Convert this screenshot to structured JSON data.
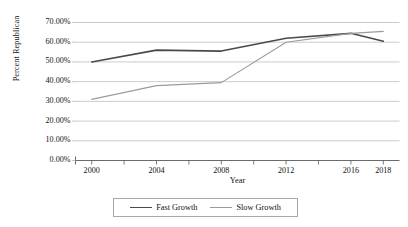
{
  "chart_data": {
    "type": "line",
    "title": "",
    "xlabel": "Year",
    "ylabel": "Percent Republican",
    "x": [
      2000,
      2002,
      2004,
      2006,
      2008,
      2010,
      2012,
      2014,
      2016,
      2018
    ],
    "categories": [
      "2000",
      "2004",
      "2008",
      "2012",
      "2016",
      "2018"
    ],
    "xlim": [
      1999,
      2019
    ],
    "ylim": [
      0,
      70
    ],
    "grid": "horizontal",
    "legend_position": "bottom",
    "xtick_labels": [
      "2000",
      "2004",
      "2008",
      "2012",
      "2016",
      "2018"
    ],
    "xtick_values": [
      2000,
      2004,
      2008,
      2012,
      2016,
      2018
    ],
    "xtick_minor_values": [
      2002,
      2006,
      2010,
      2014
    ],
    "ytick_labels": [
      "0.00%",
      "10.00%",
      "20.00%",
      "30.00%",
      "40.00%",
      "50.00%",
      "60.00%",
      "70.00%"
    ],
    "ytick_values": [
      0,
      10,
      20,
      30,
      40,
      50,
      60,
      70
    ],
    "series": [
      {
        "name": "Fast Growth",
        "color": "#4a4a4a",
        "width": 1.6,
        "x": [
          2000,
          2004,
          2008,
          2012,
          2016,
          2018
        ],
        "values": [
          50.0,
          56.0,
          55.5,
          62.0,
          64.5,
          60.5
        ]
      },
      {
        "name": "Slow Growth",
        "color": "#9b9b9b",
        "width": 1.1,
        "x": [
          2000,
          2004,
          2008,
          2012,
          2016,
          2018
        ],
        "values": [
          31.0,
          38.0,
          39.5,
          60.0,
          64.5,
          65.5
        ]
      }
    ]
  },
  "legend": {
    "entries": [
      {
        "label": "Fast Growth"
      },
      {
        "label": "Slow Growth"
      }
    ]
  },
  "axes": {
    "y_title": "Percent Republican",
    "x_title": "Year"
  },
  "colors": {
    "fast_growth": "#4a4a4a",
    "slow_growth": "#9b9b9b",
    "gridline": "#b5b5b5",
    "axis": "#5a5a5a",
    "background": "#ffffff"
  }
}
